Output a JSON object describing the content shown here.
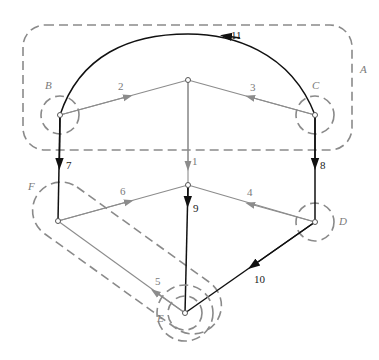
{
  "diagram": {
    "type": "directed-graph-with-cutsets",
    "colors": {
      "gray_edge": "#8c8c8c",
      "black_edge": "#111111",
      "region_dash": "#8a8a8a",
      "label_gray": "#7a7a7a",
      "label_black": "#1a1a1a"
    },
    "regions": [
      {
        "id": "A",
        "label": "A",
        "shape": "rounded-rectangle"
      },
      {
        "id": "B",
        "label": "B",
        "shape": "circle"
      },
      {
        "id": "C",
        "label": "C",
        "shape": "circle"
      },
      {
        "id": "D",
        "label": "D",
        "shape": "circle"
      },
      {
        "id": "E",
        "label": "E",
        "shape": "double-circle"
      },
      {
        "id": "F",
        "label": "F",
        "shape": "capsule"
      }
    ],
    "nodes": [
      {
        "id": "n_B",
        "near": "B"
      },
      {
        "id": "n_C",
        "near": "C"
      },
      {
        "id": "n_top",
        "near": "center-top"
      },
      {
        "id": "n_mid",
        "near": "center-middle"
      },
      {
        "id": "n_F",
        "near": "F"
      },
      {
        "id": "n_D",
        "near": "D"
      },
      {
        "id": "n_E",
        "near": "E"
      }
    ],
    "edges": [
      {
        "label": "1",
        "from": "n_top",
        "to": "n_mid",
        "style": "gray"
      },
      {
        "label": "2",
        "from": "n_B",
        "to": "n_top",
        "style": "gray"
      },
      {
        "label": "3",
        "from": "n_C",
        "to": "n_top",
        "style": "gray"
      },
      {
        "label": "4",
        "from": "n_D",
        "to": "n_mid",
        "style": "gray"
      },
      {
        "label": "5",
        "from": "n_E",
        "to": "n_F",
        "style": "gray"
      },
      {
        "label": "6",
        "from": "n_F",
        "to": "n_mid",
        "style": "gray"
      },
      {
        "label": "7",
        "from": "n_B",
        "to": "n_F",
        "style": "black"
      },
      {
        "label": "8",
        "from": "n_C",
        "to": "n_D",
        "style": "black"
      },
      {
        "label": "9",
        "from": "n_mid",
        "to": "n_E",
        "style": "black"
      },
      {
        "label": "10",
        "from": "n_D",
        "to": "n_E",
        "style": "black"
      },
      {
        "label": "11",
        "from": "n_C",
        "to": "n_B",
        "style": "black",
        "curved": true
      }
    ]
  }
}
